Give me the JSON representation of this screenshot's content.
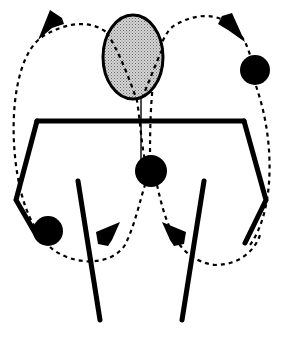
{
  "diagram": {
    "colors": {
      "background": "#ffffff",
      "ink": "#000000",
      "head_fill": "#b8b8b8"
    },
    "figure": {
      "head": {
        "cx": 133,
        "cy": 57,
        "rx": 30,
        "ry": 42
      },
      "shoulders": {
        "x1": 37,
        "y1": 121,
        "x2": 244,
        "y2": 121
      },
      "left_arm": [
        [
          37,
          121
        ],
        [
          16,
          200
        ],
        [
          38,
          238
        ]
      ],
      "right_arm": [
        [
          244,
          121
        ],
        [
          266,
          200
        ],
        [
          245,
          243
        ]
      ],
      "left_leg": {
        "x1": 78,
        "y1": 181,
        "x2": 100,
        "y2": 320
      },
      "right_leg": {
        "x1": 204,
        "y1": 181,
        "x2": 182,
        "y2": 320
      },
      "spine": {
        "x1": 141,
        "y1": 98,
        "x2": 141,
        "y2": 160
      }
    },
    "balls": [
      {
        "name": "ball-right-top",
        "cx": 255,
        "cy": 70,
        "r": 15
      },
      {
        "name": "ball-center",
        "cx": 151,
        "cy": 171,
        "r": 16
      },
      {
        "name": "ball-left-bottom",
        "cx": 48,
        "cy": 231,
        "r": 15
      }
    ],
    "paths": [
      {
        "name": "left-outer-loop",
        "d": "M 40 233 C 8 200, 0 60, 45 35 C 80 15, 115 20, 130 70 C 140 100, 140 140, 145 160"
      },
      {
        "name": "right-outer-loop",
        "d": "M 150 160 C 150 120, 150 40, 175 25 C 210 5, 240 20, 250 55 M 256 86 C 275 140, 275 210, 250 245"
      },
      {
        "name": "left-bottom-loop",
        "d": "M 50 247 C 70 265, 110 268, 125 245 C 135 225, 140 200, 145 185"
      },
      {
        "name": "right-bottom-loop",
        "d": "M 157 185 C 165 220, 175 260, 215 265 C 240 265, 255 250, 260 235"
      }
    ],
    "arrows": [
      {
        "name": "arrow-top-left",
        "points": "38,40 50,10 62,18 64,24 52,28"
      },
      {
        "name": "arrow-top-right",
        "points": "245,42 232,13 222,16 218,24 228,30"
      },
      {
        "name": "arrow-bottom-left",
        "points": "120,222 96,232 98,244 108,246 112,240"
      },
      {
        "name": "arrow-bottom-right",
        "points": "162,222 186,232 184,244 174,246 170,240"
      }
    ]
  }
}
